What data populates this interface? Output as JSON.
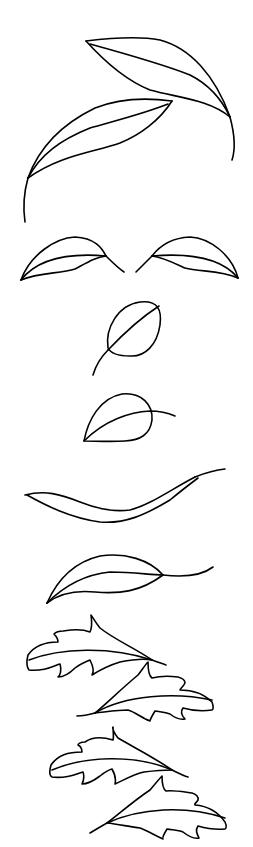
{
  "illustration": {
    "title": "Leaf line drawings",
    "background": "#ffffff",
    "stroke_color": "#000000",
    "stroke_width": 1.6,
    "groups": [
      {
        "name": "pair-of-long-leaves-top",
        "count": 2
      },
      {
        "name": "mirrored-pair-leaves",
        "count": 2
      },
      {
        "name": "round-leaf-upright",
        "count": 1
      },
      {
        "name": "round-leaf-tilted",
        "count": 1
      },
      {
        "name": "wavy-narrow-leaf",
        "count": 1
      },
      {
        "name": "leaf-with-stem",
        "count": 1
      },
      {
        "name": "lobed-oak-leaves",
        "count": 4
      }
    ]
  }
}
